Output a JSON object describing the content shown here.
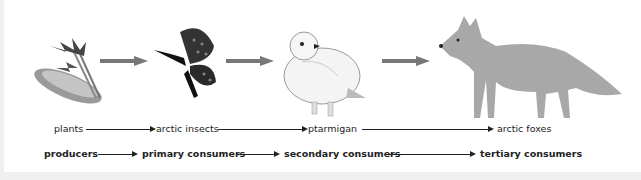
{
  "diagram": {
    "organisms": [
      {
        "name": "plants",
        "icon": "plant-icon"
      },
      {
        "name": "arctic insects",
        "icon": "butterfly-icon"
      },
      {
        "name": "ptarmigan",
        "icon": "ptarmigan-icon"
      },
      {
        "name": "arctic foxes",
        "icon": "fox-icon"
      }
    ],
    "row1": [
      "plants",
      "arctic insects",
      "ptarmigan",
      "arctic foxes"
    ],
    "row2": [
      "producers",
      "primary consumers",
      "secondary consumers",
      "tertiary consumers"
    ],
    "colors": {
      "arrow_gray": "#777777",
      "text": "#222222",
      "background": "#ffffff",
      "border": "#f0f0f0"
    }
  }
}
